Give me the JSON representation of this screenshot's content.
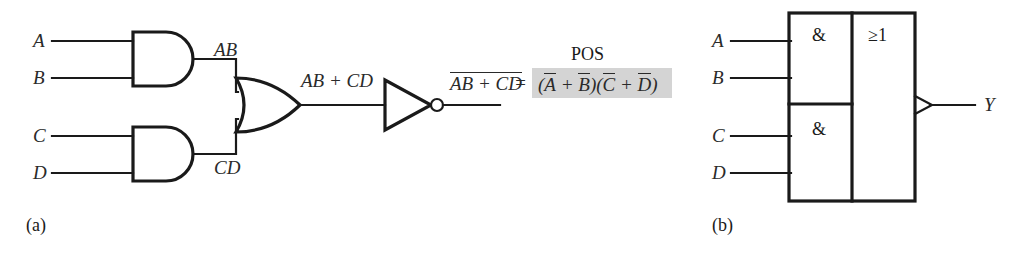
{
  "figure": {
    "parts": [
      {
        "id": "a",
        "label": "(a)",
        "x": 26,
        "y": 216
      },
      {
        "id": "b",
        "label": "(b)",
        "x": 712,
        "y": 216
      }
    ]
  },
  "distinctive_shape_diagram": {
    "inputs": [
      {
        "name": "A",
        "label": "A",
        "x": 33,
        "y": 31,
        "line_y": 41,
        "line_x1": 52,
        "line_x2": 131
      },
      {
        "name": "B",
        "label": "B",
        "x": 33,
        "y": 68,
        "line_y": 78,
        "line_x1": 52,
        "line_x2": 131
      },
      {
        "name": "C",
        "label": "C",
        "x": 33,
        "y": 126,
        "line_y": 136,
        "line_x1": 52,
        "line_x2": 131
      },
      {
        "name": "D",
        "label": "D",
        "x": 33,
        "y": 163,
        "line_y": 173,
        "line_x1": 52,
        "line_x2": 131
      }
    ],
    "gates": [
      {
        "name": "and-gate-ab",
        "type": "AND",
        "x": 131,
        "y": 32,
        "w": 62,
        "h": 54
      },
      {
        "name": "and-gate-cd",
        "type": "AND",
        "x": 131,
        "y": 127,
        "w": 62,
        "h": 54
      },
      {
        "name": "or-gate",
        "type": "OR",
        "x": 236,
        "y": 78,
        "w": 64,
        "h": 54
      },
      {
        "name": "inverter",
        "type": "NOT",
        "x": 383,
        "y": 80,
        "w": 50,
        "h": 50
      }
    ],
    "net_labels": [
      {
        "name": "label-ab",
        "text": "AB",
        "x": 214,
        "y": 40
      },
      {
        "name": "label-cd",
        "text": "CD",
        "x": 214,
        "y": 158
      },
      {
        "name": "label-or-output",
        "text": "AB + CD",
        "x": 301,
        "y": 71
      }
    ],
    "output_expression": {
      "inverted_term": "AB + CD",
      "equals": "=",
      "pos_label": "POS",
      "pos_expression_parts": [
        "(",
        "A",
        " + ",
        "B",
        ")(",
        "C",
        " + ",
        "D",
        ")"
      ],
      "pos_expression_plain": "(A̅ + B̅)(C̅ + D̅)",
      "highlight_color": "#d4d4d4"
    }
  },
  "iec_rectangular_diagram": {
    "inputs": [
      {
        "name": "A",
        "label": "A",
        "x": 712,
        "y": 31,
        "line_y": 41,
        "line_x1": 731,
        "line_x2": 789
      },
      {
        "name": "B",
        "label": "B",
        "x": 712,
        "y": 68,
        "line_y": 78,
        "line_x1": 731,
        "line_x2": 789
      },
      {
        "name": "C",
        "label": "C",
        "x": 712,
        "y": 126,
        "line_y": 136,
        "line_x1": 731,
        "line_x2": 789
      },
      {
        "name": "D",
        "label": "D",
        "x": 712,
        "y": 163,
        "line_y": 173,
        "line_x1": 731,
        "line_x2": 789
      }
    ],
    "blocks": [
      {
        "name": "and-block-ab",
        "symbol": "&",
        "sym_x": 812,
        "sym_y": 26
      },
      {
        "name": "and-block-cd",
        "symbol": "&",
        "sym_x": 812,
        "sym_y": 120
      },
      {
        "name": "or-block",
        "symbol": "≥1",
        "sym_x": 868,
        "sym_y": 26
      }
    ],
    "box": {
      "x": 789,
      "y": 13,
      "w": 126,
      "h": 188,
      "divider_x": 852,
      "split_y": 104
    },
    "output": {
      "name": "Y",
      "label": "Y",
      "label_x": 984,
      "label_y": 95,
      "line_y": 105,
      "line_x1": 915,
      "line_x2": 975,
      "negation": "wedge"
    }
  },
  "colors": {
    "background": "#ffffff",
    "ink": "#1a1a1a",
    "label_ink": "#2a2a2a",
    "highlight": "#d4d4d4"
  }
}
